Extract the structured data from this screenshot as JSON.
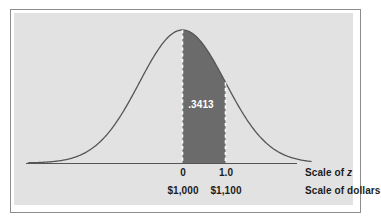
{
  "figure": {
    "title": "",
    "panel_color": "#e2e2e2",
    "frame_color": "#8d8d8d",
    "curve_color": "#555555",
    "shade_color": "#6b6b6b",
    "dash_color": "#ffffff",
    "axis_color": "#555555",
    "text_color": "#1c1c1c",
    "area_label_color": "#ffffff"
  },
  "labels": {
    "area": ".3413",
    "z_tick_0": "0",
    "z_tick_1": "1.0",
    "dollar_tick_0": "$1,000",
    "dollar_tick_1": "$1,100",
    "scale_of_z_prefix": "Scale of ",
    "scale_of_z_symbol": "z",
    "scale_of_dollars": "Scale of dollars"
  },
  "chart_data": {
    "type": "area",
    "distribution": "normal",
    "mean_z": 0,
    "sd_z": 1,
    "mean_dollars": 1000,
    "sd_dollars": 100,
    "xlabel": "Scale of z",
    "xlabel_secondary": "Scale of dollars",
    "ylabel": "",
    "grid": false,
    "legend": "none",
    "xlim_z": [
      -3.6,
      3.0
    ],
    "shaded_region": {
      "from_z": 0,
      "to_z": 1.0,
      "from_dollars": 1000,
      "to_dollars": 1100,
      "area": 0.3413,
      "area_label": ".3413",
      "fill": "#6b6b6b",
      "boundary_style": "dashed-white"
    },
    "axis_ticks_z": [
      {
        "z": 0,
        "label": "0"
      },
      {
        "z": 1.0,
        "label": "1.0"
      }
    ],
    "axis_ticks_dollars": [
      {
        "z": 0,
        "label": "$1,000"
      },
      {
        "z": 1.0,
        "label": "$1,100"
      }
    ],
    "x": [
      -3.6,
      -3.4,
      -3.2,
      -3.0,
      -2.8,
      -2.6,
      -2.4,
      -2.2,
      -2.0,
      -1.8,
      -1.6,
      -1.4,
      -1.2,
      -1.0,
      -0.8,
      -0.6,
      -0.4,
      -0.2,
      0.0,
      0.2,
      0.4,
      0.6,
      0.8,
      1.0,
      1.2,
      1.4,
      1.6,
      1.8,
      2.0,
      2.2,
      2.4,
      2.6,
      2.8,
      3.0
    ],
    "y": [
      0.0006,
      0.0012,
      0.0024,
      0.0044,
      0.0079,
      0.0136,
      0.0224,
      0.0355,
      0.054,
      0.079,
      0.1109,
      0.1497,
      0.1942,
      0.242,
      0.2897,
      0.3332,
      0.3683,
      0.391,
      0.3989,
      0.391,
      0.3683,
      0.3332,
      0.2897,
      0.242,
      0.1942,
      0.1497,
      0.1109,
      0.079,
      0.054,
      0.0355,
      0.0224,
      0.0136,
      0.0079,
      0.0044
    ]
  }
}
